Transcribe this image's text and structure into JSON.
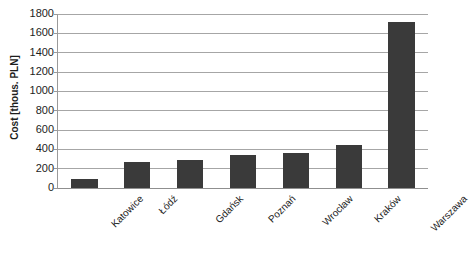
{
  "chart_data": {
    "type": "bar",
    "title": "",
    "xlabel": "",
    "ylabel": "Cost [thous. PLN]",
    "categories": [
      "Katowice",
      "Łódź",
      "Gdańsk",
      "Poznań",
      "Wrocław",
      "Kraków",
      "Warszawa"
    ],
    "values": [
      90,
      270,
      285,
      340,
      360,
      445,
      1715
    ],
    "ylim": [
      0,
      1800
    ],
    "ytick_labels": [
      "1800",
      "1600",
      "1400",
      "1200",
      "1000",
      "800",
      "600",
      "400",
      "200",
      "0"
    ],
    "ytick_values": [
      1800,
      1600,
      1400,
      1200,
      1000,
      800,
      600,
      400,
      200,
      0
    ],
    "grid": true,
    "legend": "none",
    "series": [
      {
        "name": "Cost",
        "color": "#3a3a3a",
        "values": [
          90,
          270,
          285,
          340,
          360,
          445,
          1715
        ]
      }
    ],
    "colors": {
      "bar": "#3a3a3a",
      "gridline": "#a6a6a6",
      "axis": "#9a9a9a",
      "text": "#1d1d1d",
      "background": "#ffffff"
    }
  }
}
